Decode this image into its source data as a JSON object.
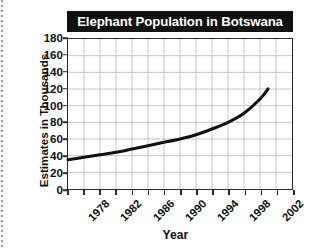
{
  "chart_data": {
    "type": "line",
    "title": "Elephant Population in Botswana",
    "xlabel": "Year",
    "ylabel": "Estimates in Thousands",
    "xlim": [
      1978,
      2006
    ],
    "ylim": [
      0,
      180
    ],
    "grid": true,
    "legend": "none",
    "y_ticks": [
      0,
      20,
      40,
      60,
      80,
      100,
      120,
      140,
      160,
      180
    ],
    "x_ticks": [
      1978,
      1982,
      1986,
      1990,
      1994,
      1998,
      2002,
      2006
    ],
    "x_minor_step": 2,
    "series": [
      {
        "name": "Elephant population",
        "x": [
          1978,
          1980,
          1982,
          1984,
          1986,
          1988,
          1990,
          1992,
          1994,
          1996,
          1998,
          2000,
          2002,
          2003
        ],
        "values": [
          35,
          38,
          41,
          44,
          48,
          52,
          56,
          60,
          65,
          72,
          80,
          91,
          108,
          120
        ]
      }
    ],
    "line_color": "#111111",
    "grid_color": "#b8b8b8",
    "axis_color": "#2b2b2b",
    "title_background": "#111111",
    "title_color": "#ffffff"
  }
}
